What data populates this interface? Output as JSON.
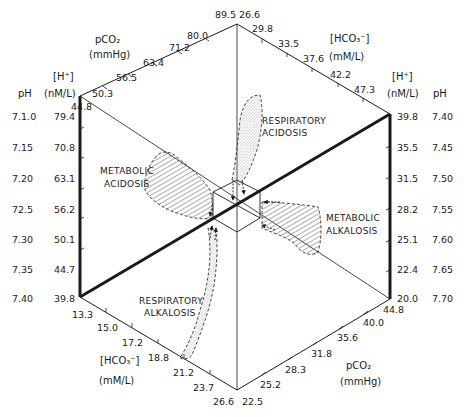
{
  "diagram": {
    "type": "acid-base nomogram (hexagonal)",
    "left_axis": {
      "ph_header": "pH",
      "h_header_bracket": "[H⁺]",
      "h_header_units": "(nM/L)",
      "ph_values": [
        "7.1.0",
        "7.15",
        "7.20",
        "72.5",
        "7.30",
        "7.35",
        "7.40"
      ],
      "h_values": [
        "79.4",
        "70.8",
        "63.1",
        "56.2",
        "50.1",
        "44.7",
        "39.8"
      ]
    },
    "right_axis": {
      "ph_header": "pH",
      "h_header_bracket": "[H⁺]",
      "h_header_units": "(nM/L)",
      "h_values": [
        "39.8",
        "35.5",
        "31.5",
        "28.2",
        "25.1",
        "22.4",
        "20.0"
      ],
      "ph_values": [
        "7.40",
        "7.45",
        "7.50",
        "7.55",
        "7.60",
        "7.65",
        "7.70"
      ]
    },
    "upper_left_axis": {
      "title": "pCO₂",
      "units": "(mmHg)",
      "values": [
        "44.8",
        "50.3",
        "56.5",
        "63.4",
        "71.2",
        "80.0",
        "89.5"
      ]
    },
    "upper_right_axis": {
      "title": "[HCO₃⁻]",
      "units": "(mM/L)",
      "values": [
        "26.6",
        "29.8",
        "33.5",
        "37.6",
        "42.2",
        "47.3"
      ]
    },
    "lower_left_axis": {
      "title": "[HCO₃⁻]",
      "units": "(mM/L)",
      "values": [
        "13.3",
        "15.0",
        "17.2",
        "18.8",
        "21.2",
        "23.7",
        "26.6"
      ]
    },
    "lower_right_axis": {
      "title": "pCO₂",
      "units": "(mmHg)",
      "values": [
        "22.5",
        "25.2",
        "28.3",
        "31.8",
        "35.6",
        "40.0",
        "44.8"
      ]
    },
    "regions": {
      "respiratory_acidosis": [
        "RESPIRATORY",
        "ACIDOSIS"
      ],
      "metabolic_acidosis": [
        "METABOLIC",
        "ACIDOSIS"
      ],
      "metabolic_alkalosis": [
        "METABOLIC",
        "ALKALOSIS"
      ],
      "respiratory_alkalosis": [
        "RESPIRATORY",
        "ALKALOSIS"
      ]
    },
    "colors": {
      "line": "#1a1a1a",
      "stipple": "#9a9a9a",
      "hatch": "#4a4a4a",
      "background": "#ffffff"
    }
  }
}
